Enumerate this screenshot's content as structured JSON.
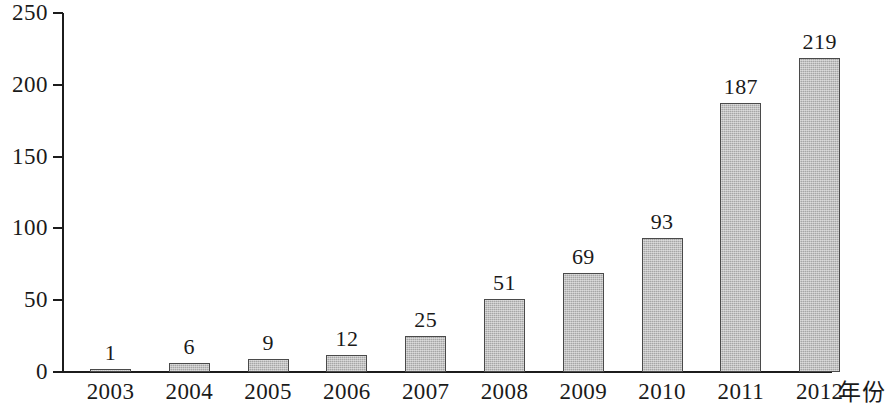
{
  "chart_data": {
    "type": "bar",
    "title": "",
    "subtitle": "",
    "xlabel": "年份",
    "ylabel": "",
    "categories": [
      "2003",
      "2004",
      "2005",
      "2006",
      "2007",
      "2008",
      "2009",
      "2010",
      "2011",
      "2012"
    ],
    "values": [
      1,
      6,
      9,
      12,
      25,
      51,
      69,
      93,
      187,
      219
    ],
    "value_labels": [
      "1",
      "6",
      "9",
      "12",
      "25",
      "51",
      "69",
      "93",
      "187",
      "219"
    ],
    "ylim": [
      0,
      250
    ],
    "yticks": [
      0,
      50,
      100,
      150,
      200,
      250
    ],
    "ytick_labels": [
      "0",
      "50",
      "100",
      "150",
      "200",
      "250"
    ],
    "grid": false,
    "legend": false,
    "legend_position": "none",
    "bar_fill_color": "#a6a6a6",
    "bar_border_color": "#4a4a4a",
    "axis_color": "#1c1c1c",
    "background_color": "#ffffff",
    "show_value_labels": true
  }
}
